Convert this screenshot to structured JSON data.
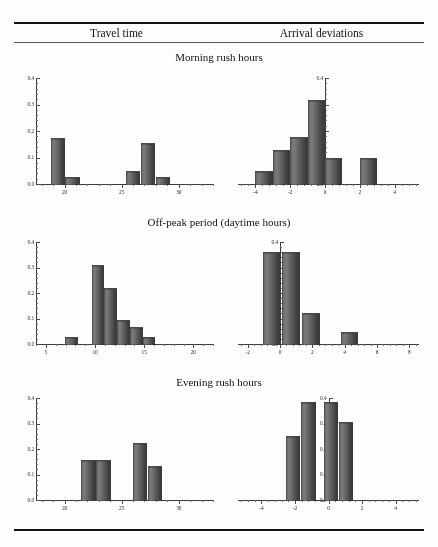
{
  "document": {
    "ghost_top_text": "",
    "column_headers": [
      "Travel time",
      "Arrival deviations"
    ],
    "panel_titles": [
      "Morning rush hours",
      "Off-peak period (daytime hours)",
      "Evening rush hours"
    ]
  },
  "chart_data": [
    {
      "id": "morning-travel-time",
      "type": "bar",
      "title": "Morning rush hours",
      "column": "Travel time",
      "xlabel": "",
      "ylabel": "",
      "xlim": [
        17.5,
        33.0
      ],
      "ylim": [
        0.0,
        0.4
      ],
      "xticks": [
        20,
        25,
        30
      ],
      "xtick_labels": [
        "20",
        "25",
        "30"
      ],
      "yticks": [
        0.0,
        0.1,
        0.2,
        0.3,
        0.4
      ],
      "ytick_labels": [
        "0.0",
        "0.1",
        "0.2",
        "0.3",
        "0.4"
      ],
      "grid": false,
      "bin_width": 1.25,
      "bars": [
        {
          "x": 19.4,
          "value": 0.172
        },
        {
          "x": 20.7,
          "value": 0.025
        },
        {
          "x": 26.0,
          "value": 0.05
        },
        {
          "x": 27.3,
          "value": 0.155
        },
        {
          "x": 28.6,
          "value": 0.027
        }
      ]
    },
    {
      "id": "morning-arrival-deviations",
      "type": "bar",
      "title": "Morning rush hours",
      "column": "Arrival deviations",
      "xlabel": "",
      "ylabel": "",
      "xlim": [
        -5.0,
        5.4
      ],
      "ylim": [
        0.0,
        0.4
      ],
      "xticks": [
        -4,
        -2,
        0,
        2,
        4
      ],
      "xtick_labels": [
        "-4",
        "-2",
        "0",
        "2",
        "4"
      ],
      "yticks": [
        0.0,
        0.1,
        0.2,
        0.3,
        0.4
      ],
      "ytick_labels": [
        "0.0",
        "0.1",
        "0.2",
        "0.3",
        "0.4"
      ],
      "grid": false,
      "bin_width": 1.0,
      "bars": [
        {
          "x": -3.5,
          "value": 0.048
        },
        {
          "x": -2.5,
          "value": 0.128
        },
        {
          "x": -1.5,
          "value": 0.178
        },
        {
          "x": -0.5,
          "value": 0.318
        },
        {
          "x": 0.5,
          "value": 0.1
        },
        {
          "x": 2.5,
          "value": 0.1
        }
      ]
    },
    {
      "id": "offpeak-travel-time",
      "type": "bar",
      "title": "Off-peak period (daytime hours)",
      "column": "Travel time",
      "xlabel": "",
      "ylabel": "",
      "xlim": [
        4.0,
        22.0
      ],
      "ylim": [
        0.0,
        0.4
      ],
      "xticks": [
        5,
        10,
        15,
        20
      ],
      "xtick_labels": [
        "5",
        "10",
        "15",
        "20"
      ],
      "yticks": [
        0.0,
        0.1,
        0.2,
        0.3,
        0.4
      ],
      "ytick_labels": [
        "0.0",
        "0.1",
        "0.2",
        "0.3",
        "0.4"
      ],
      "grid": false,
      "bin_width": 1.3,
      "bars": [
        {
          "x": 7.6,
          "value": 0.026
        },
        {
          "x": 10.3,
          "value": 0.311
        },
        {
          "x": 11.6,
          "value": 0.221
        },
        {
          "x": 12.9,
          "value": 0.094
        },
        {
          "x": 14.2,
          "value": 0.065
        },
        {
          "x": 15.5,
          "value": 0.028
        }
      ]
    },
    {
      "id": "offpeak-arrival-deviations",
      "type": "bar",
      "title": "Off-peak period (daytime hours)",
      "column": "Arrival deviations",
      "xlabel": "",
      "ylabel": "",
      "xlim": [
        -2.6,
        8.6
      ],
      "ylim": [
        0.0,
        0.4
      ],
      "xticks": [
        -2,
        0,
        2,
        4,
        6,
        8
      ],
      "xtick_labels": [
        "-2",
        "0",
        "2",
        "4",
        "6",
        "8"
      ],
      "yticks": [
        0.0,
        0.1,
        0.2,
        0.3,
        0.4
      ],
      "ytick_labels": [
        "0.0",
        "0.1",
        "0.2",
        "0.3",
        "0.4"
      ],
      "grid": false,
      "bin_width": 1.1,
      "bars": [
        {
          "x": -0.5,
          "value": 0.362
        },
        {
          "x": 0.7,
          "value": 0.362
        },
        {
          "x": 1.9,
          "value": 0.122
        },
        {
          "x": 4.3,
          "value": 0.046
        }
      ]
    },
    {
      "id": "evening-travel-time",
      "type": "bar",
      "title": "Evening rush hours",
      "column": "Travel time",
      "xlabel": "",
      "ylabel": "",
      "xlim": [
        17.5,
        33.0
      ],
      "ylim": [
        0.0,
        0.4
      ],
      "xticks": [
        20,
        25,
        30
      ],
      "xtick_labels": [
        "20",
        "25",
        "30"
      ],
      "yticks": [
        0.0,
        0.1,
        0.2,
        0.3,
        0.4
      ],
      "ytick_labels": [
        "0.0",
        "0.1",
        "0.2",
        "0.3",
        "0.4"
      ],
      "grid": false,
      "bin_width": 1.25,
      "bars": [
        {
          "x": 22.1,
          "value": 0.155
        },
        {
          "x": 23.4,
          "value": 0.155
        },
        {
          "x": 26.6,
          "value": 0.222
        },
        {
          "x": 27.9,
          "value": 0.132
        }
      ]
    },
    {
      "id": "evening-arrival-deviations",
      "type": "bar",
      "title": "Evening rush hours",
      "column": "Arrival deviations",
      "xlabel": "",
      "ylabel": "",
      "xlim": [
        -5.4,
        5.4
      ],
      "ylim": [
        0.0,
        0.4
      ],
      "xticks": [
        -4,
        -2,
        0,
        2,
        4
      ],
      "xtick_labels": [
        "-4",
        "-2",
        "0",
        "2",
        "4"
      ],
      "yticks": [
        0.0,
        0.1,
        0.2,
        0.3,
        0.4
      ],
      "ytick_labels": [
        "0.0",
        "0.1",
        "0.2",
        "0.3",
        "0.4"
      ],
      "grid": false,
      "bin_width": 0.85,
      "bars": [
        {
          "x": -2.1,
          "value": 0.252
        },
        {
          "x": -1.2,
          "value": 0.385
        },
        {
          "x": 0.15,
          "value": 0.385
        },
        {
          "x": 1.05,
          "value": 0.307
        }
      ]
    }
  ],
  "layout": {
    "charts": [
      {
        "id": "morning-travel-time",
        "left": 14,
        "top": 72,
        "width": 205,
        "height": 128,
        "pad_left": 22,
        "pad_bottom": 16,
        "pad_top": 6,
        "pad_right": 6,
        "yaxis_at": "left"
      },
      {
        "id": "morning-arrival-deviations",
        "left": 224,
        "top": 72,
        "width": 205,
        "height": 128,
        "pad_left": 14,
        "pad_bottom": 16,
        "pad_top": 6,
        "pad_right": 10,
        "yaxis_at": "zero"
      },
      {
        "id": "offpeak-travel-time",
        "left": 14,
        "top": 236,
        "width": 205,
        "height": 122,
        "pad_left": 22,
        "pad_bottom": 14,
        "pad_top": 6,
        "pad_right": 6,
        "yaxis_at": "left"
      },
      {
        "id": "offpeak-arrival-deviations",
        "left": 224,
        "top": 236,
        "width": 205,
        "height": 122,
        "pad_left": 14,
        "pad_bottom": 14,
        "pad_top": 6,
        "pad_right": 10,
        "yaxis_at": "zero"
      },
      {
        "id": "evening-travel-time",
        "left": 14,
        "top": 392,
        "width": 205,
        "height": 124,
        "pad_left": 22,
        "pad_bottom": 16,
        "pad_top": 6,
        "pad_right": 6,
        "yaxis_at": "left"
      },
      {
        "id": "evening-arrival-deviations",
        "left": 224,
        "top": 392,
        "width": 205,
        "height": 124,
        "pad_left": 14,
        "pad_bottom": 16,
        "pad_top": 6,
        "pad_right": 10,
        "yaxis_at": "zero"
      }
    ]
  }
}
